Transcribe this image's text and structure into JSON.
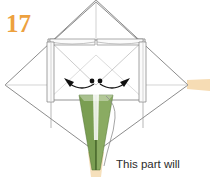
{
  "figure": {
    "type": "origami-instruction-diagram",
    "step_number": "17",
    "step_number_color": "#eda13f",
    "caption": {
      "line1": "This part will",
      "line2": "become the stem.",
      "full_text": "This part will become the stem.",
      "color": "#2b2b2b"
    },
    "colors": {
      "paper_fill": "#ffffff",
      "paper_outline": "#6b6b6b",
      "crease_line": "#b8b8b8",
      "stem_green": "#7a9e52",
      "stem_green_dark": "#4f7030",
      "stem_green_light": "#9cb870",
      "tan_tab": "#f6dcb4",
      "arrow_black": "#111111",
      "leader_line": "#8a8a8a"
    },
    "annotations": {
      "dot_count": 2,
      "arrow_count": 2,
      "arrow_directions": [
        "left",
        "right"
      ],
      "arrow_style": "curved-spread-open"
    },
    "shapes": {
      "outer_diamond": "square rotated 45 degrees",
      "top_peak": "triangular peak at top center",
      "side_flaps": 2,
      "top_flaps": 2,
      "stem": "narrow green tapering triangle pointing down",
      "right_tab": "tan horizontal tab at right point",
      "bottom_tab": "tan tab at bottom tip"
    }
  }
}
